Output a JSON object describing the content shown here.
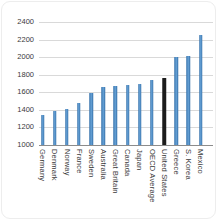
{
  "chart_data": {
    "type": "bar",
    "title": "",
    "xlabel": "",
    "ylabel": "",
    "categories": [
      "Germany",
      "Denmark",
      "Norway",
      "France",
      "Sweden",
      "Australia",
      "Great Britain",
      "Canada",
      "Japan",
      "OECD Average",
      "United States",
      "Greece",
      "S. Korea",
      "Mexico"
    ],
    "values": [
      1340,
      1390,
      1410,
      1475,
      1595,
      1660,
      1670,
      1685,
      1700,
      1740,
      1765,
      2000,
      2010,
      2250
    ],
    "highlight_category": "United States",
    "highlight_index": 10,
    "ylim": [
      1000,
      2400
    ],
    "yticks": [
      1000,
      1200,
      1400,
      1600,
      1800,
      2000,
      2200,
      2400
    ],
    "grid": "horizontal",
    "legend_position": "none",
    "x_label_orientation": "vertical",
    "colors": {
      "bar": "#3E86C6",
      "highlight_bar": "#1C1C1C",
      "gridline": "#D9D9D9",
      "baseline": "#8C8C8C",
      "tick_text": "#3A3A3A",
      "background": "#FFFFFF"
    }
  }
}
